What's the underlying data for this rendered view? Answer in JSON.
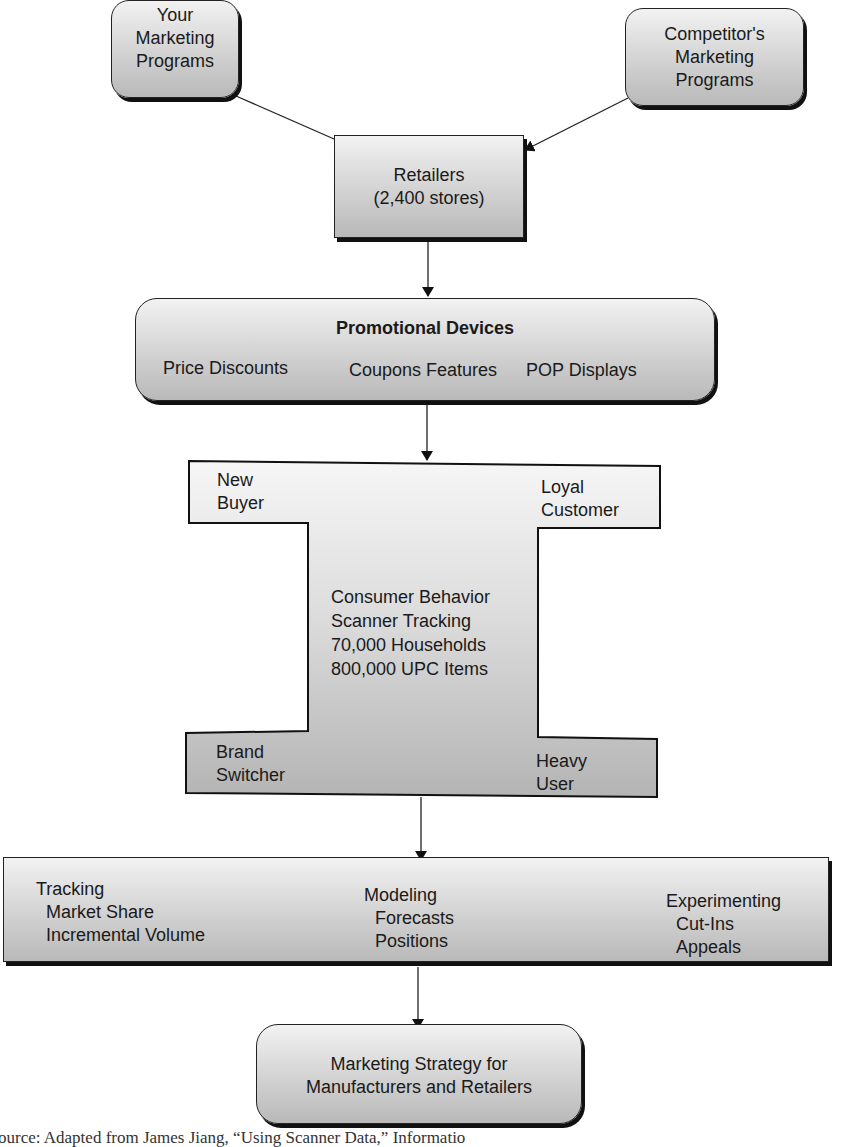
{
  "nodes": {
    "your_programs": {
      "lines": [
        "Your",
        "Marketing",
        "Programs"
      ]
    },
    "competitor_programs": {
      "lines": [
        "Competitor's",
        "Marketing",
        "Programs"
      ]
    },
    "retailers": {
      "lines": [
        "Retailers",
        "(2,400 stores)"
      ]
    },
    "promotional_devices": {
      "title": "Promotional Devices",
      "items": [
        "Price Discounts",
        "Coupons Features",
        "POP Displays"
      ]
    },
    "consumer_behavior": {
      "corners": {
        "top_left": [
          "New",
          "Buyer"
        ],
        "top_right": [
          "Loyal",
          "Customer"
        ],
        "bottom_left": [
          "Brand",
          "Switcher"
        ],
        "bottom_right": [
          "Heavy",
          "User"
        ]
      },
      "center": [
        "Consumer Behavior",
        "Scanner Tracking",
        "70,000 Households",
        "800,000 UPC Items"
      ]
    },
    "analysis": {
      "columns": [
        {
          "title": "Tracking",
          "items": [
            "Market Share",
            "Incremental Volume"
          ]
        },
        {
          "title": "Modeling",
          "items": [
            "Forecasts",
            "Positions"
          ]
        },
        {
          "title": "Experimenting",
          "items": [
            "Cut-Ins",
            "Appeals"
          ]
        }
      ]
    },
    "strategy": {
      "lines": [
        "Marketing Strategy for",
        "Manufacturers and Retailers"
      ]
    }
  },
  "source_text": "ource: Adapted from James Jiang, “Using Scanner Data,” Informatio"
}
